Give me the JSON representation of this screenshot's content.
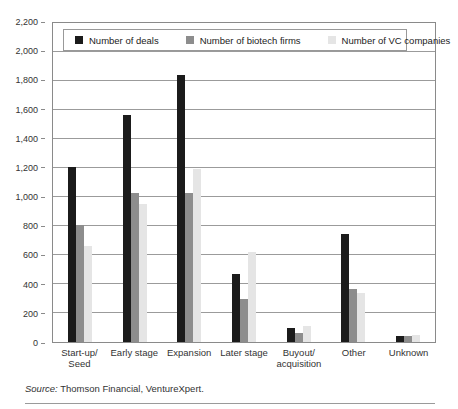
{
  "figure": {
    "source_prefix": "Source:",
    "source_rest": " Thomson Financial, VentureXpert."
  },
  "chart_data": {
    "type": "bar",
    "title": "",
    "xlabel": "",
    "ylabel": "",
    "categories": [
      "Start-up/\nSeed",
      "Early stage",
      "Expansion",
      "Later stage",
      "Buyout/\nacquisition",
      "Other",
      "Unknown"
    ],
    "series": [
      {
        "name": "Number of deals",
        "color": "#1b1b1b",
        "values": [
          1210,
          1565,
          1840,
          470,
          95,
          745,
          40
        ]
      },
      {
        "name": "Number of biotech firms",
        "color": "#8d8d8d",
        "values": [
          805,
          1025,
          1030,
          300,
          60,
          365,
          40
        ]
      },
      {
        "name": "Number of VC companies",
        "color": "#e5e5e5",
        "values": [
          665,
          955,
          1195,
          620,
          110,
          340,
          45
        ]
      }
    ],
    "ylim": [
      0,
      2200
    ],
    "ytick_step": 200,
    "ytick_labels": [
      "0",
      "200",
      "400",
      "600",
      "800",
      "1,000",
      "1,200",
      "1,400",
      "1,600",
      "1,800",
      "2,000",
      "2,200"
    ],
    "grid": true,
    "legend_position": "top-inside"
  }
}
